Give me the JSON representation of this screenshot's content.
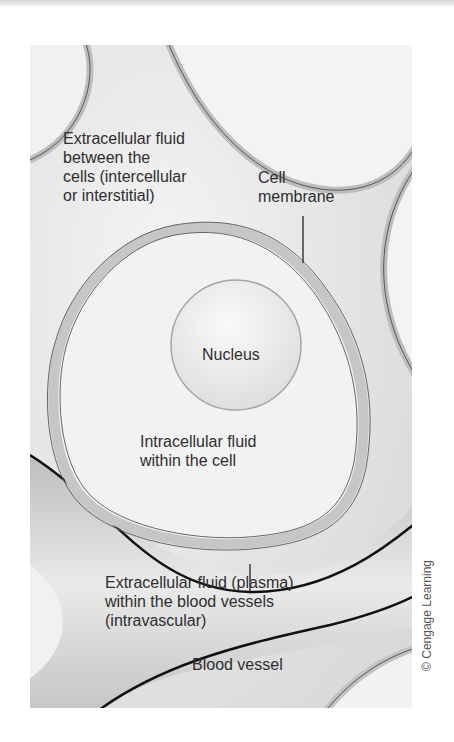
{
  "diagram": {
    "title": "",
    "labels": {
      "extracellular_interstitial": "Extracellular fluid\nbetween the\ncells (intercellular\nor interstitial)",
      "cell_membrane": "Cell\nmembrane",
      "nucleus": "Nucleus",
      "intracellular": "Intracellular fluid\nwithin the cell",
      "plasma": "Extracellular fluid (plasma)\nwithin the blood vessels\n(intravascular)",
      "blood_vessel": "Blood vessel"
    },
    "credit": "© Cengage Learning",
    "colors": {
      "background": "#e9e9e9",
      "cell_fill": "#f2f2f2",
      "membrane": "#bdbdbd",
      "membrane_line": "#555555",
      "vessel_line": "#111111"
    }
  }
}
